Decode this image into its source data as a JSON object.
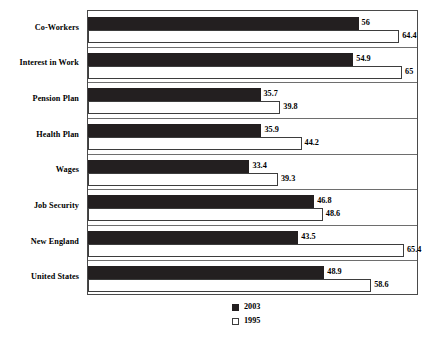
{
  "chart_data": {
    "type": "bar",
    "orientation": "horizontal",
    "title": "",
    "subtitle": "",
    "xlabel": "",
    "ylabel": "",
    "grid": false,
    "legend_position": "bottom",
    "xlim": [
      0,
      68.5
    ],
    "categories": [
      "Co-Workers",
      "Interest in Work",
      "Pension Plan",
      "Health Plan",
      "Wages",
      "Job Security",
      "New England",
      "United States"
    ],
    "series": [
      {
        "name": "2003",
        "color": "#231f20",
        "style": "filled",
        "values": [
          56,
          54.9,
          35.7,
          35.9,
          33.4,
          46.8,
          43.5,
          48.9
        ],
        "labels": [
          "56",
          "54.9",
          "35.7",
          "35.9",
          "33.4",
          "46.8",
          "43.5",
          "48.9"
        ]
      },
      {
        "name": "1995",
        "color": "#ffffff",
        "style": "open",
        "values": [
          64.4,
          65,
          39.8,
          44.2,
          39.3,
          48.6,
          65.4,
          58.6
        ],
        "labels": [
          "64.4",
          "65",
          "39.8",
          "44.2",
          "39.3",
          "48.6",
          "65.4",
          "58.6"
        ]
      }
    ]
  },
  "legend": {
    "entries": [
      {
        "label": "2003",
        "swatch": "filled-square-icon"
      },
      {
        "label": "1995",
        "swatch": "open-square-icon"
      }
    ]
  }
}
